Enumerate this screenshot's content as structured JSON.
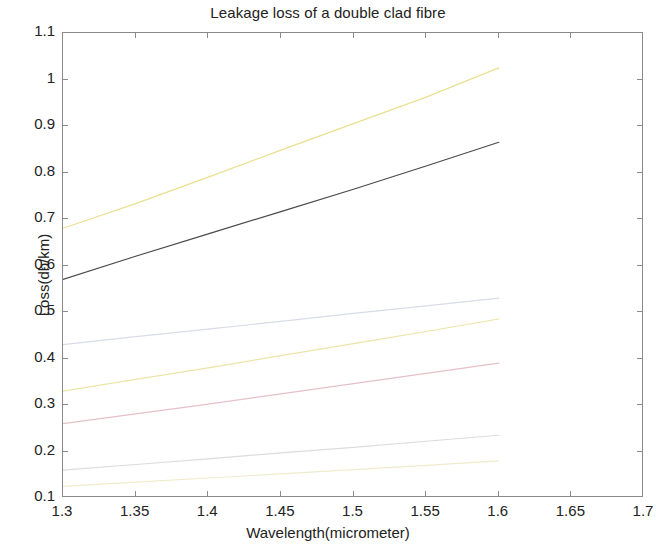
{
  "chart_data": {
    "type": "line",
    "title": "Leakage loss of a double clad fibre",
    "xlabel": "Wavelength(micrometer)",
    "ylabel": "Loss(db/km)",
    "xlim": [
      1.3,
      1.7
    ],
    "ylim": [
      0.1,
      1.1
    ],
    "xticks": [
      "1.3",
      "1.35",
      "1.4",
      "1.45",
      "1.5",
      "1.55",
      "1.6",
      "1.65",
      "1.7"
    ],
    "xtick_values": [
      1.3,
      1.35,
      1.4,
      1.45,
      1.5,
      1.55,
      1.6,
      1.65,
      1.7
    ],
    "yticks": [
      "0.1",
      "0.2",
      "0.3",
      "0.4",
      "0.5",
      "0.6",
      "0.7",
      "0.8",
      "0.9",
      "1",
      "1.1"
    ],
    "ytick_values": [
      0.1,
      0.2,
      0.3,
      0.4,
      0.5,
      0.6,
      0.7,
      0.8,
      0.9,
      1.0,
      1.1
    ],
    "grid": false,
    "legend": "none",
    "x": [
      1.3,
      1.35,
      1.4,
      1.45,
      1.5,
      1.55,
      1.6
    ],
    "series": [
      {
        "name": "curve-1",
        "color": "#e8e090",
        "width": 1.2,
        "values": [
          0.68,
          0.733,
          0.79,
          0.848,
          0.905,
          0.962,
          1.025
        ]
      },
      {
        "name": "curve-2",
        "color": "#4a4a4a",
        "width": 1.2,
        "values": [
          0.57,
          0.62,
          0.668,
          0.716,
          0.764,
          0.814,
          0.865
        ]
      },
      {
        "name": "curve-3",
        "color": "#d8dce8",
        "width": 1.2,
        "values": [
          0.43,
          0.447,
          0.463,
          0.48,
          0.497,
          0.513,
          0.53
        ]
      },
      {
        "name": "curve-4",
        "color": "#ece4a8",
        "width": 1.2,
        "values": [
          0.33,
          0.355,
          0.38,
          0.406,
          0.432,
          0.458,
          0.485
        ]
      },
      {
        "name": "curve-5",
        "color": "#e6c0c8",
        "width": 1.2,
        "values": [
          0.26,
          0.281,
          0.302,
          0.324,
          0.346,
          0.368,
          0.39
        ]
      },
      {
        "name": "curve-6",
        "color": "#dcdcdc",
        "width": 1.2,
        "values": [
          0.16,
          0.172,
          0.184,
          0.197,
          0.209,
          0.222,
          0.235
        ]
      },
      {
        "name": "curve-7",
        "color": "#efeccc",
        "width": 1.2,
        "values": [
          0.125,
          0.134,
          0.143,
          0.152,
          0.161,
          0.17,
          0.18
        ]
      }
    ]
  },
  "axes": {
    "frame_color": "#8a8a8a"
  }
}
